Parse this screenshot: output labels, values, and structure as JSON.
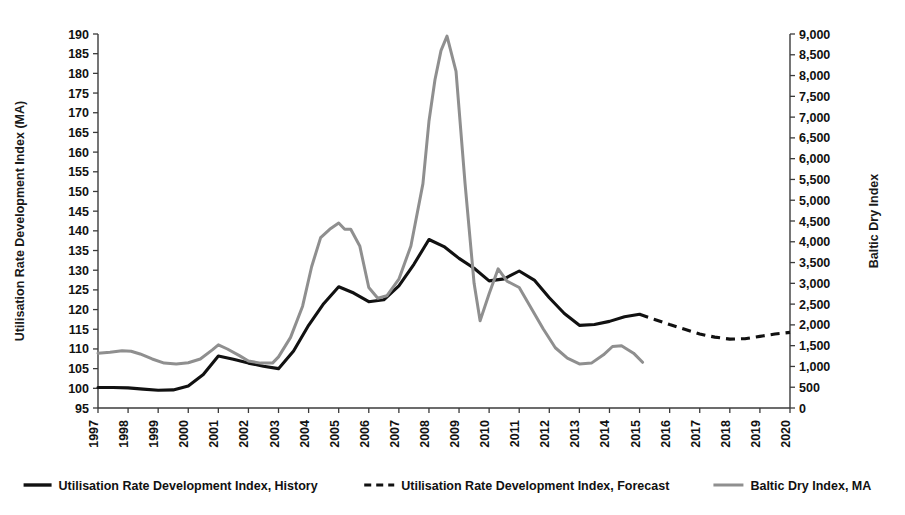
{
  "chart_data": {
    "type": "line",
    "title": "",
    "xlabel": "",
    "ylabel": "Utilisation Rate Development Index (MA)",
    "y2label": "Baltic Dry Index",
    "grid": false,
    "legend_position": "bottom",
    "xlim": [
      1997,
      2020
    ],
    "ylim": [
      95,
      190
    ],
    "y2lim": [
      0,
      9000
    ],
    "x_tick_labels": [
      "1997",
      "1998",
      "1999",
      "2000",
      "2001",
      "2002",
      "2003",
      "2004",
      "2005",
      "2006",
      "2007",
      "2008",
      "2009",
      "2010",
      "2011",
      "2012",
      "2013",
      "2014",
      "2015",
      "2016",
      "2017",
      "2018",
      "2019",
      "2020"
    ],
    "y_tick_labels": [
      "95",
      "100",
      "105",
      "110",
      "115",
      "120",
      "125",
      "130",
      "135",
      "140",
      "145",
      "150",
      "155",
      "160",
      "165",
      "170",
      "175",
      "180",
      "185",
      "190"
    ],
    "y2_tick_labels": [
      "0",
      "500",
      "1,000",
      "1,500",
      "2,000",
      "2,500",
      "3,000",
      "3,500",
      "4,000",
      "4,500",
      "5,000",
      "5,500",
      "6,000",
      "6,500",
      "7,000",
      "7,500",
      "8,000",
      "8,500",
      "9,000"
    ],
    "series": [
      {
        "name": "Utilisation Rate Development Index, History",
        "axis": "left",
        "style": "solid",
        "color": "#111111",
        "x": [
          1997,
          1997.5,
          1998,
          1998.5,
          1999,
          1999.5,
          2000,
          2000.5,
          2001,
          2001.5,
          2002,
          2002.5,
          2003,
          2003.5,
          2004,
          2004.5,
          2005,
          2005.5,
          2006,
          2006.5,
          2007,
          2007.5,
          2008,
          2008.5,
          2009,
          2009.5,
          2010,
          2010.5,
          2011,
          2011.5,
          2012,
          2012.5,
          2013,
          2013.5,
          2014,
          2014.5,
          2015
        ],
        "values": [
          100.2,
          100.2,
          100.1,
          99.8,
          99.5,
          99.6,
          100.6,
          103.5,
          108.2,
          107.4,
          106.4,
          105.6,
          105.0,
          109.5,
          116.0,
          121.5,
          125.8,
          124.2,
          122.0,
          122.5,
          126.0,
          131.5,
          137.8,
          136.0,
          133.0,
          130.5,
          127.3,
          127.8,
          129.8,
          127.5,
          123.0,
          119.0,
          116.0,
          116.2,
          117.0,
          118.2,
          118.8
        ]
      },
      {
        "name": "Utilisation Rate Development Index, Forecast",
        "axis": "left",
        "style": "dashed",
        "color": "#111111",
        "x": [
          2015,
          2015.5,
          2016,
          2016.5,
          2017,
          2017.5,
          2018,
          2018.5,
          2019,
          2019.5,
          2020
        ],
        "values": [
          118.8,
          117.5,
          116.2,
          115.0,
          113.8,
          113.0,
          112.5,
          112.6,
          113.2,
          113.8,
          114.2
        ]
      },
      {
        "name": "Baltic Dry Index, MA",
        "axis": "right",
        "style": "solid",
        "color": "#8f8f8f",
        "x": [
          1997,
          1997.4,
          1997.8,
          1998.1,
          1998.4,
          1998.8,
          1999.2,
          1999.6,
          2000,
          2000.4,
          2000.8,
          2001,
          2001.3,
          2001.7,
          2002,
          2002.4,
          2002.8,
          2003,
          2003.4,
          2003.8,
          2004.1,
          2004.4,
          2004.7,
          2005,
          2005.2,
          2005.4,
          2005.7,
          2006,
          2006.3,
          2006.6,
          2007,
          2007.4,
          2007.8,
          2008,
          2008.2,
          2008.4,
          2008.6,
          2008.9,
          2009.2,
          2009.5,
          2009.7,
          2010,
          2010.3,
          2010.6,
          2011,
          2011.4,
          2011.8,
          2012.2,
          2012.6,
          2013,
          2013.4,
          2013.8,
          2014.1,
          2014.4,
          2014.8,
          2015.1
        ],
        "values": [
          1320,
          1340,
          1380,
          1365,
          1300,
          1180,
          1080,
          1060,
          1090,
          1180,
          1400,
          1520,
          1420,
          1260,
          1130,
          1080,
          1080,
          1230,
          1700,
          2450,
          3400,
          4100,
          4300,
          4450,
          4300,
          4300,
          3900,
          2900,
          2640,
          2700,
          3100,
          3900,
          5400,
          6900,
          7900,
          8600,
          8950,
          8100,
          5400,
          3000,
          2100,
          2750,
          3350,
          3050,
          2900,
          2400,
          1900,
          1450,
          1200,
          1060,
          1080,
          1280,
          1480,
          1500,
          1320,
          1100
        ]
      }
    ]
  },
  "legend": {
    "items": [
      {
        "label": "Utilisation Rate Development Index, History",
        "style": "solid",
        "color": "#111111"
      },
      {
        "label": "Utilisation Rate Development Index, Forecast",
        "style": "dashed",
        "color": "#111111"
      },
      {
        "label": "Baltic Dry Index, MA",
        "style": "solid",
        "color": "#8f8f8f"
      }
    ]
  }
}
